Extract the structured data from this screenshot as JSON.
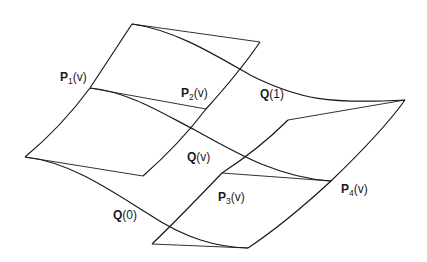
{
  "diagram": {
    "type": "ruled-surface-interpolation",
    "labels": {
      "p1": {
        "bold": "P",
        "sub": "1",
        "arg": "(v)"
      },
      "p2": {
        "bold": "P",
        "sub": "2",
        "arg": "(v)"
      },
      "p3": {
        "bold": "P",
        "sub": "3",
        "arg": "(v)"
      },
      "p4": {
        "bold": "P",
        "sub": "4",
        "arg": "(v)"
      },
      "q1": {
        "bold": "Q",
        "arg": "(1)"
      },
      "qv": {
        "bold": "Q",
        "arg": "(v)"
      },
      "q0": {
        "bold": "Q",
        "arg": "(0)"
      }
    },
    "stroke_color": "#1a1a1a",
    "background": "#ffffff"
  }
}
